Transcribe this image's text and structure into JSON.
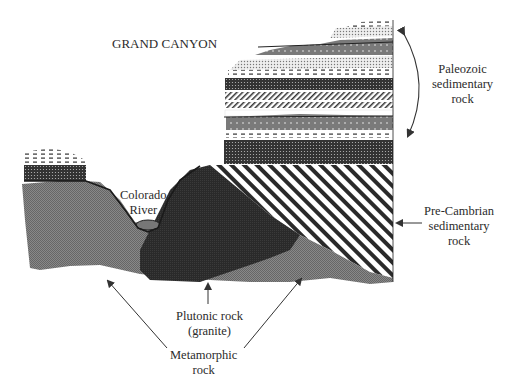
{
  "title": "GRAND CANYON",
  "labels": {
    "paleozoic": [
      "Paleozoic",
      "sedimentary",
      "rock"
    ],
    "colorado": [
      "Colorado",
      "River"
    ],
    "precambrian": [
      "Pre-Cambrian",
      "sedimentary",
      "rock"
    ],
    "plutonic": [
      "Plutonic rock",
      "(granite)"
    ],
    "metamorphic": [
      "Metamorphic",
      "rock"
    ]
  },
  "colors": {
    "metamorphic": "#7d7d7d",
    "plutonic": "#2e2e2e",
    "dark_layer": "#3a3a3a",
    "mid_layer": "#8a8a8a",
    "light_layer": "#d0d0d0",
    "text": "#2b2b2b",
    "arrow": "#333333"
  }
}
